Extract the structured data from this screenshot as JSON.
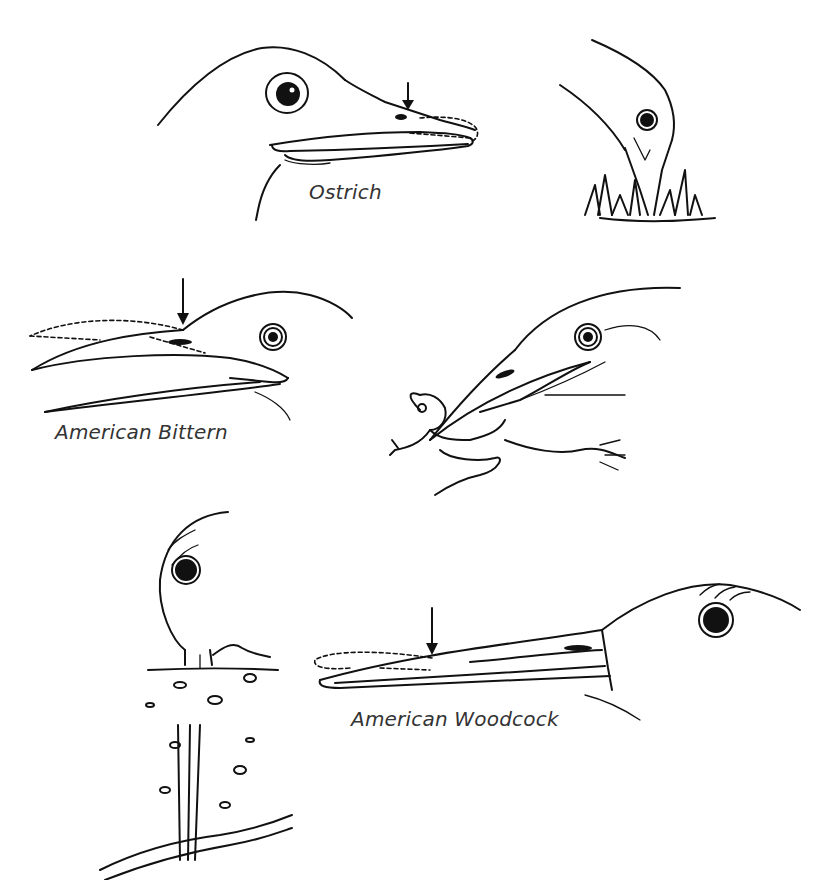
{
  "figure": {
    "panels": [
      {
        "id": "ostrich-head",
        "label": "Ostrich",
        "has_arrow": true
      },
      {
        "id": "ostrich-feeding",
        "label": "",
        "has_arrow": false,
        "scene": "grazing in grass"
      },
      {
        "id": "bittern-head",
        "label": "American Bittern",
        "has_arrow": true
      },
      {
        "id": "bittern-feeding",
        "label": "",
        "has_arrow": false,
        "scene": "catching frog"
      },
      {
        "id": "woodcock-probing",
        "label": "",
        "has_arrow": false,
        "scene": "probing soil for worm"
      },
      {
        "id": "woodcock-head",
        "label": "American Woodcock",
        "has_arrow": true
      }
    ],
    "colors": {
      "ink": "#111111",
      "background": "#ffffff",
      "label": "#333333"
    }
  }
}
